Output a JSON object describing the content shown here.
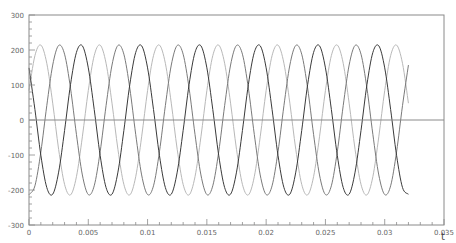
{
  "chart_data": {
    "type": "line",
    "title": "",
    "xlabel": "t",
    "ylabel": "",
    "xlim": [
      0,
      0.035
    ],
    "ylim": [
      -300,
      300
    ],
    "grid": false,
    "legend": null,
    "x_ticks": [
      "0",
      "0.005",
      "0.01",
      "0.015",
      "0.02",
      "0.025",
      "0.03",
      "0.035"
    ],
    "x_tick_values": [
      0,
      0.005,
      0.01,
      0.015,
      0.02,
      0.025,
      0.03,
      0.035
    ],
    "y_ticks": [
      "300",
      "200",
      "100",
      "0",
      "-100",
      "-200",
      "-300"
    ],
    "y_tick_values": [
      300,
      200,
      100,
      0,
      -100,
      -200,
      -300
    ],
    "annotations": [
      "horizontal line at y=0"
    ],
    "x_step": 0.0005,
    "x_start": 0,
    "series": [
      {
        "name": "phase-a",
        "color": "#b8b8b8",
        "values": [
          84,
          184,
          214,
          162,
          48,
          -84,
          -184,
          -214,
          -162,
          -48,
          84,
          184,
          214,
          162,
          48,
          -84,
          -184,
          -214,
          -162,
          -48,
          84,
          184,
          214,
          162,
          48,
          -84,
          -184,
          -214,
          -162,
          -48,
          84,
          184,
          214,
          162,
          48,
          -84,
          -184,
          -214,
          -162,
          -48,
          84,
          184,
          214,
          162,
          48,
          -84,
          -184,
          -214,
          -162,
          -48,
          84,
          184,
          214,
          162,
          48,
          -84,
          -184,
          -214,
          -162,
          -48,
          84,
          184,
          214,
          162,
          48
        ]
      },
      {
        "name": "phase-b",
        "color": "#7a7a7a",
        "values": [
          -213,
          -188,
          -91,
          41,
          157,
          213,
          188,
          91,
          -41,
          -157,
          -213,
          -188,
          -91,
          41,
          157,
          213,
          188,
          91,
          -41,
          -157,
          -213,
          -188,
          -91,
          41,
          157,
          213,
          188,
          91,
          -41,
          -157,
          -213,
          -188,
          -91,
          41,
          157,
          213,
          188,
          91,
          -41,
          -157,
          -213,
          -188,
          -91,
          41,
          157,
          213,
          188,
          91,
          -41,
          -157,
          -213,
          -188,
          -91,
          41,
          157,
          213,
          188,
          91,
          -41,
          -157,
          -213,
          -188,
          -91,
          41,
          157
        ]
      },
      {
        "name": "phase-c",
        "color": "#3a3a3a",
        "values": [
          149,
          30,
          -101,
          -193,
          -212,
          -149,
          -30,
          101,
          193,
          212,
          149,
          30,
          -101,
          -193,
          -212,
          -149,
          -30,
          101,
          193,
          212,
          149,
          30,
          -101,
          -193,
          -212,
          -149,
          -30,
          101,
          193,
          212,
          149,
          30,
          -101,
          -193,
          -212,
          -149,
          -30,
          101,
          193,
          212,
          149,
          30,
          -101,
          -193,
          -212,
          -149,
          -30,
          101,
          193,
          212,
          149,
          30,
          -101,
          -193,
          -212,
          -149,
          -30,
          101,
          193,
          212,
          149,
          30,
          -101,
          -193,
          -212
        ]
      }
    ]
  },
  "colors": {
    "axis": "#8a8a8a",
    "zero_line": "#8a8a8a",
    "background": "#ffffff"
  }
}
